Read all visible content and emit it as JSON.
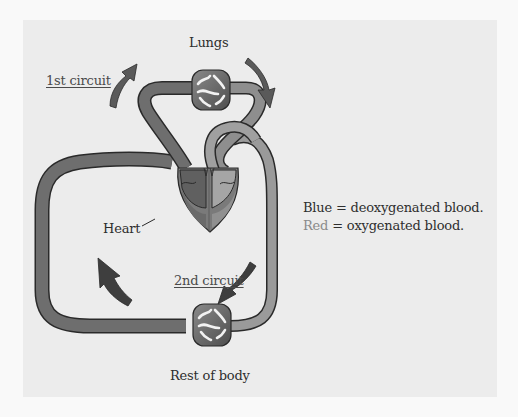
{
  "diagram": {
    "labels": {
      "lungs": "Lungs",
      "first_circuit": "1st circuit",
      "heart": "Heart",
      "second_circuit": "2nd circuit",
      "rest_of_body": "Rest of body"
    },
    "legend": [
      {
        "key": "Blue",
        "separator": " = ",
        "value": "deoxygenated blood."
      },
      {
        "key": "Red",
        "separator": " = ",
        "value": "oxygenated blood."
      }
    ],
    "colors": {
      "page_background": "#f9f9f9",
      "panel_background": "#ececec",
      "deoxygenated_vessel": "#6e6e6e",
      "oxygenated_vessel": "#9a9a9a",
      "vessel_outline": "#2a2a2a",
      "arrow_fill": "#555555",
      "capillary_fill": "#6a6a6a",
      "text": "#2e2e2e",
      "legend_red_key": "#8a8a8a"
    },
    "nodes": [
      {
        "id": "lungs",
        "label": "Lungs",
        "circuit": "1st circuit"
      },
      {
        "id": "heart",
        "label": "Heart"
      },
      {
        "id": "rest-of-body",
        "label": "Rest of body",
        "circuit": "2nd circuit"
      }
    ],
    "edges": [
      {
        "from": "heart",
        "to": "lungs",
        "blood": "deoxygenated",
        "circuit": "1st circuit"
      },
      {
        "from": "lungs",
        "to": "heart",
        "blood": "oxygenated",
        "circuit": "1st circuit"
      },
      {
        "from": "heart",
        "to": "rest-of-body",
        "blood": "oxygenated",
        "circuit": "2nd circuit"
      },
      {
        "from": "rest-of-body",
        "to": "heart",
        "blood": "deoxygenated",
        "circuit": "2nd circuit"
      }
    ]
  }
}
